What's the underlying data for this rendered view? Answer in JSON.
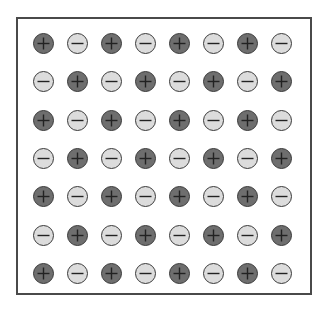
{
  "diagram": {
    "title": "",
    "rows": 7,
    "cols": 8,
    "colors": {
      "positive_fill": "#6e6e6e",
      "negative_fill": "#dcdcdc",
      "outline": "#3a3a3a",
      "sign": "#222222",
      "frame": "#4a4a4a"
    },
    "layout": {
      "first_center_x": 44,
      "first_center_y": 44,
      "dx": 34,
      "dy": 38.3,
      "radius": 11
    },
    "grid": [
      [
        "+",
        "-",
        "+",
        "-",
        "+",
        "-",
        "+",
        "-"
      ],
      [
        "-",
        "+",
        "-",
        "+",
        "-",
        "+",
        "-",
        "+"
      ],
      [
        "+",
        "-",
        "+",
        "-",
        "+",
        "-",
        "+",
        "-"
      ],
      [
        "-",
        "+",
        "-",
        "+",
        "-",
        "+",
        "-",
        "+"
      ],
      [
        "+",
        "-",
        "+",
        "-",
        "+",
        "-",
        "+",
        "-"
      ],
      [
        "-",
        "+",
        "-",
        "+",
        "-",
        "+",
        "-",
        "+"
      ],
      [
        "+",
        "-",
        "+",
        "-",
        "+",
        "-",
        "+",
        "-"
      ]
    ]
  }
}
